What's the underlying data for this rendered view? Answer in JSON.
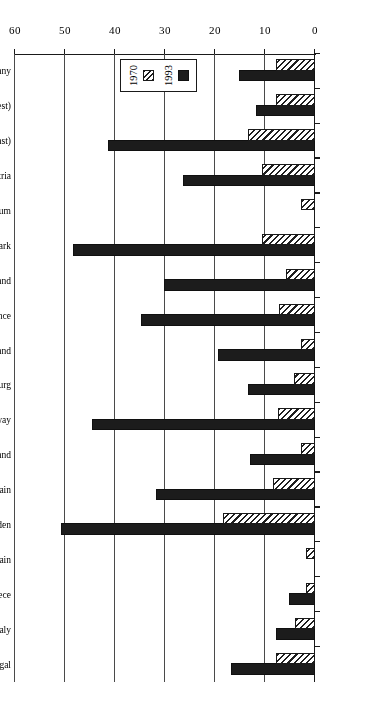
{
  "chart_data": {
    "type": "bar",
    "orientation": "horizontal",
    "title": "",
    "xlabel": "Births Outside Marriage Per 100 Births",
    "ylabel": "",
    "xlim": [
      0,
      60
    ],
    "xticks": [
      0,
      10,
      20,
      30,
      40,
      50,
      60
    ],
    "grid": true,
    "legend_position": "upper-left",
    "categories": [
      "Germany",
      "(West)",
      "(East)",
      "Austria",
      "Belgium",
      "Denmark",
      "Finland",
      "France",
      "Ireland",
      "Luxemburg",
      "Norway",
      "Holland",
      "Britain",
      "Sweden",
      "Spain",
      "Greece",
      "Italy",
      "Portugal"
    ],
    "series": [
      {
        "name": "1970",
        "values": [
          7.4,
          7.4,
          13.0,
          10.2,
          2.4,
          10.2,
          5.4,
          6.8,
          2.4,
          3.8,
          7.0,
          2.4,
          8.0,
          18.0,
          1.4,
          1.4,
          3.6,
          7.4
        ]
      },
      {
        "name": "1993",
        "values": [
          14.8,
          11.4,
          41.0,
          26.0,
          0.0,
          48.0,
          29.8,
          34.4,
          19.0,
          13.0,
          44.2,
          12.6,
          31.4,
          50.4,
          0.0,
          4.8,
          7.4,
          16.4
        ]
      }
    ]
  },
  "legend": {
    "entries": [
      {
        "label": "1970",
        "swatch": "hatched"
      },
      {
        "label": "1993",
        "swatch": "solid-black"
      }
    ]
  },
  "axis": {
    "x_title": "Births Outside Marriage Per 100 Births",
    "tick_labels": [
      "0",
      "10",
      "20",
      "30",
      "40",
      "50",
      "60"
    ]
  }
}
